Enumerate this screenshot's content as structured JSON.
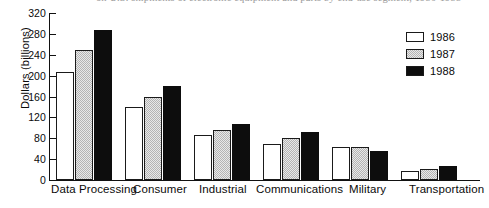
{
  "title": {
    "text": "on U.S. shipments of electronic equipment and parts by end-use segment, 1986-1988",
    "clipped": true
  },
  "axis": {
    "y_label": "Dollars (billions)",
    "y_ticks": [
      "320",
      "280",
      "240",
      "200",
      "160",
      "120",
      "80",
      "40",
      "0"
    ],
    "y_min": 0,
    "y_max": 320,
    "y_step": 40
  },
  "legend": {
    "entries": [
      {
        "label": "1986",
        "swatch": "white",
        "color": "#ffffff"
      },
      {
        "label": "1987",
        "swatch": "light-gray-dither",
        "color": "#d0d0d0"
      },
      {
        "label": "1988",
        "swatch": "black",
        "color": "#0d0d0d"
      }
    ]
  },
  "chart_data": {
    "type": "bar",
    "title": "on U.S. shipments of electronic equipment and parts by end-use segment, 1986-1988",
    "xlabel": "",
    "ylabel": "Dollars (billions)",
    "ylim": [
      0,
      320
    ],
    "ytick_step": 40,
    "grid": false,
    "legend_position": "top-right",
    "categories": [
      "Data Processing",
      "Consumer",
      "Industrial",
      "Communications",
      "Military",
      "Transportation"
    ],
    "series": [
      {
        "name": "1986",
        "values": [
          207,
          140,
          86,
          69,
          64,
          18
        ]
      },
      {
        "name": "1987",
        "values": [
          249,
          159,
          96,
          81,
          64,
          21
        ]
      },
      {
        "name": "1988",
        "values": [
          287,
          180,
          108,
          92,
          55,
          26
        ]
      }
    ]
  }
}
